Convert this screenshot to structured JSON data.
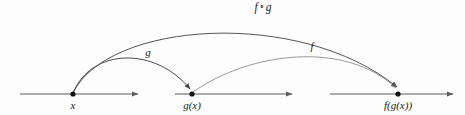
{
  "figure": {
    "kind": "function-composition-diagram",
    "background_color": "#fdfdfd",
    "axis_color": "#5c5c5c",
    "arc_color_g": "#4a4a4a",
    "arc_color_f": "#9a9a9a",
    "arc_color_composite": "#555555",
    "point_color": "#111111",
    "label_color": "#1a1a1a"
  },
  "number_lines": [
    {
      "name": "domain-line",
      "x_start": 20,
      "x_end": 144,
      "y": 94
    },
    {
      "name": "codomain-line",
      "x_start": 175,
      "x_end": 298,
      "y": 94
    },
    {
      "name": "range-line",
      "x_start": 330,
      "x_end": 459,
      "y": 94
    }
  ],
  "points": [
    {
      "id": "x",
      "label": "x",
      "cx": 73,
      "cy": 94,
      "label_x": 73,
      "label_y": 100
    },
    {
      "id": "gx",
      "label": "g(x)",
      "cx": 192,
      "cy": 94,
      "label_x": 192,
      "label_y": 100
    },
    {
      "id": "fgx",
      "label": "f(g(x))",
      "cx": 398,
      "cy": 94,
      "label_x": 398,
      "label_y": 100
    }
  ],
  "arcs": [
    {
      "id": "arc-g",
      "label": "g",
      "from": "x",
      "to": "gx",
      "label_x": 148,
      "label_y": 47,
      "color": "#4a4a4a"
    },
    {
      "id": "arc-f",
      "label": "f",
      "from": "gx",
      "to": "fgx",
      "label_x": 312,
      "label_y": 41,
      "color": "#9a9a9a"
    },
    {
      "id": "arc-f-compose-g",
      "label_f": "f",
      "label_op": "∘",
      "label_g": "g",
      "from": "x",
      "to": "fgx",
      "label_x": 263,
      "label_y": 2,
      "color": "#555555"
    }
  ],
  "labels": {
    "x": "x",
    "gx": "g(x)",
    "fgx": "f(g(x))",
    "g_arc": "g",
    "f_arc": "f",
    "compose_f": "f",
    "compose_op": "∘",
    "compose_g": "g"
  }
}
